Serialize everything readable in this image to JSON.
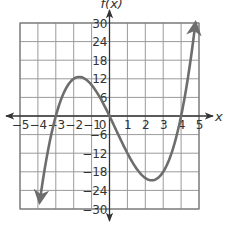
{
  "chart_data": {
    "type": "line",
    "title": "",
    "xlabel": "x",
    "ylabel": "f(x)",
    "xlim": [
      -5,
      5
    ],
    "ylim": [
      -30,
      30
    ],
    "grid": true,
    "x_ticks": [
      -5,
      -4,
      -3,
      -2,
      -1,
      0,
      1,
      2,
      3,
      4,
      5
    ],
    "x_tick_labels": [
      "−5",
      "−4",
      "−3",
      "−2",
      "−1",
      "0",
      "1",
      "2",
      "3",
      "4",
      "5"
    ],
    "y_ticks": [
      -30,
      -24,
      -18,
      -12,
      -6,
      6,
      12,
      18,
      24,
      30
    ],
    "y_tick_labels": [
      "−30",
      "−24",
      "−18",
      "−12",
      "−6",
      "6",
      "12",
      "18",
      "24",
      "30"
    ],
    "series": [
      {
        "name": "f(x)",
        "function": "x(x+3)(x-4)",
        "x_range": [
          -3.9,
          4.8
        ],
        "x": [
          -3.9,
          -3.5,
          -3,
          -2.5,
          -2,
          -1.5,
          -1,
          -0.5,
          0,
          0.5,
          1,
          1.5,
          2,
          2.4,
          3,
          3.5,
          4,
          4.5,
          4.8
        ],
        "values": [
          -27.4,
          -13.1,
          0,
          8.1,
          12,
          12.4,
          10,
          5.6,
          0,
          -6.1,
          -12,
          -16.9,
          -20,
          -20.7,
          -18,
          -12.3,
          0,
          18.6,
          29.6
        ],
        "roots": [
          -3,
          0,
          4
        ],
        "local_max": [
          -2,
          12.5
        ],
        "local_min": [
          2.4,
          -20.7
        ],
        "arrows_at_ends": true,
        "color": "#6d6d6d"
      }
    ],
    "colors": {
      "grid": "#9a9a9a",
      "axis": "#333333",
      "curve": "#6d6d6d"
    }
  }
}
